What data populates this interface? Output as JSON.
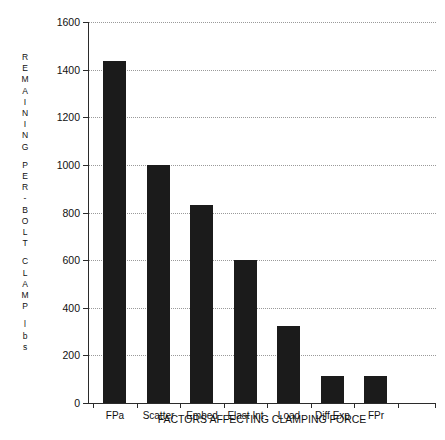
{
  "chart_data": {
    "type": "bar",
    "title": "",
    "xlabel": "FACTORS AFFECTING CLAMPING FORCE",
    "ylabel": "REMAINING PER-BOLT CLAMP lbs",
    "ylabel_lines": [
      "REMAINING",
      "PER-BOLT",
      "CLAMP",
      "lbs"
    ],
    "categories": [
      "FPa",
      "Scatter",
      "Embed",
      "Elast Int",
      "Load",
      "Diff Exp",
      "FPr"
    ],
    "values": [
      1435,
      1000,
      830,
      600,
      325,
      115,
      115
    ],
    "ylim": [
      0,
      1600
    ],
    "ytick_labels": [
      "0",
      "200",
      "400",
      "600",
      "800",
      "1000",
      "1200",
      "1400",
      "1600"
    ],
    "ytick_values": [
      0,
      200,
      400,
      600,
      800,
      1000,
      1200,
      1400,
      1600
    ],
    "grid": true,
    "grid_axis": "y",
    "grid_style": "dotted",
    "legend": "none",
    "bar_color": "#1b1b1b",
    "background_color": "#ffffff"
  }
}
